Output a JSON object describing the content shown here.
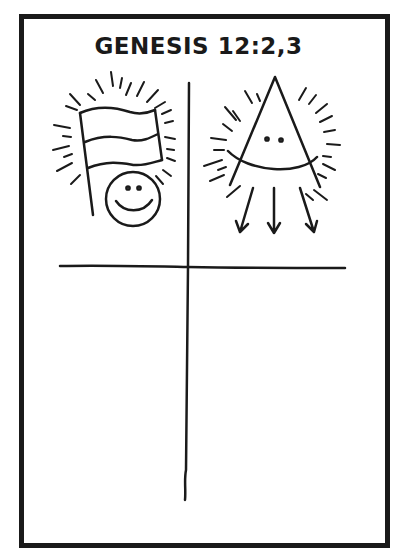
{
  "title": "GENESIS 12:2,3",
  "colors": {
    "ink": "#1a1a1a",
    "paper": "#ffffff"
  },
  "layout": {
    "quadrants": [
      {
        "position": "top-left",
        "content": "flag-with-smiley-face",
        "rays": true
      },
      {
        "position": "top-right",
        "content": "triangle-face-with-three-arrows",
        "rays": true
      },
      {
        "position": "bottom-left",
        "content": "empty"
      },
      {
        "position": "bottom-right",
        "content": "empty"
      }
    ],
    "dividers": [
      "vertical-divider",
      "horizontal-divider"
    ]
  }
}
